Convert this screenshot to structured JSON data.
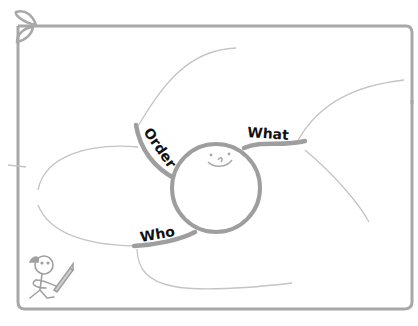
{
  "diagram": {
    "type": "mind-map",
    "center": {
      "shape": "smiley-face-circle"
    },
    "branches": [
      {
        "label": "Order",
        "position": "upper-left"
      },
      {
        "label": "What",
        "position": "upper-right"
      },
      {
        "label": "Who",
        "position": "lower-left"
      }
    ],
    "decorations": [
      "leaf-sprout-corner",
      "stick-figure-with-pencil"
    ]
  },
  "colors": {
    "frame": "#a8a8a8",
    "branch": "#9e9e9e",
    "thin_line": "#c4c4c4",
    "text": "#111111",
    "background": "#ffffff"
  }
}
